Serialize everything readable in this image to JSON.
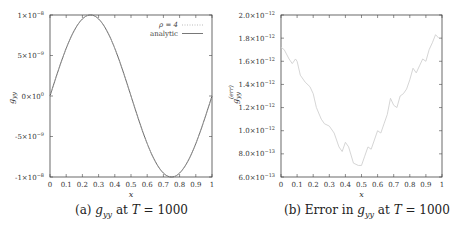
{
  "chart_data": [
    {
      "type": "line",
      "id": "a",
      "caption": {
        "prefix": "(a)",
        "var": "g",
        "sub": "yy",
        "suffix": "at",
        "T": "T",
        "eq": "= 1000"
      },
      "xlabel": "x",
      "ylabel": "g_yy",
      "xlim": [
        0,
        1
      ],
      "ylim": [
        -1e-08,
        1e-08
      ],
      "xticks": [
        "0",
        "0.1",
        "0.2",
        "0.3",
        "0.4",
        "0.5",
        "0.6",
        "0.7",
        "0.8",
        "0.9",
        "1"
      ],
      "yticks": [
        {
          "value": 1e-08,
          "label": "1×10",
          "exp": "−8"
        },
        {
          "value": 5e-09,
          "label": "5×10",
          "exp": "−9"
        },
        {
          "value": 0,
          "label": "0×10",
          "exp": "0"
        },
        {
          "value": -5e-09,
          "label": "-5×10",
          "exp": "−9"
        },
        {
          "value": -1e-08,
          "label": "-1×10",
          "exp": "−8"
        }
      ],
      "legend": {
        "position": "upper right",
        "entries": [
          {
            "label": "ρ = 4",
            "style": "dotted",
            "color": "#aaaaaa"
          },
          {
            "label": "analytic",
            "style": "solid",
            "color": "#555555"
          }
        ]
      },
      "series": [
        {
          "name": "ρ = 4",
          "function": "1e-8*sin(2*pi*x)",
          "color": "#aaaaaa"
        },
        {
          "name": "analytic",
          "function": "1e-8*sin(2*pi*x)",
          "color": "#555555"
        }
      ],
      "grid": false
    },
    {
      "type": "line",
      "id": "b",
      "caption": {
        "prefix": "(b) Error in",
        "var": "g",
        "sub": "yy",
        "suffix": "at",
        "T": "T",
        "eq": "= 1000"
      },
      "xlabel": "x",
      "ylabel": "g_yy^(err)",
      "xlim": [
        0,
        1
      ],
      "ylim": [
        6e-13,
        2e-12
      ],
      "xticks": [
        "0",
        "0.1",
        "0.2",
        "0.3",
        "0.4",
        "0.5",
        "0.6",
        "0.7",
        "0.8",
        "0.9",
        "1"
      ],
      "yticks": [
        {
          "value": 2e-12,
          "label": "2.0×10",
          "exp": "−12"
        },
        {
          "value": 1.8e-12,
          "label": "1.8×10",
          "exp": "−12"
        },
        {
          "value": 1.6e-12,
          "label": "1.6×10",
          "exp": "−12"
        },
        {
          "value": 1.4e-12,
          "label": "1.4×10",
          "exp": "−12"
        },
        {
          "value": 1.2e-12,
          "label": "1.2×10",
          "exp": "−12"
        },
        {
          "value": 1e-12,
          "label": "1.0×10",
          "exp": "−12"
        },
        {
          "value": 8e-13,
          "label": "8.0×10",
          "exp": "−13"
        },
        {
          "value": 6e-13,
          "label": "6.0×10",
          "exp": "−13"
        }
      ],
      "series": [
        {
          "name": "error",
          "color": "#d0d0d0",
          "x": [
            0,
            0.02,
            0.05,
            0.07,
            0.09,
            0.1,
            0.12,
            0.15,
            0.18,
            0.2,
            0.22,
            0.25,
            0.27,
            0.3,
            0.33,
            0.36,
            0.38,
            0.4,
            0.42,
            0.45,
            0.48,
            0.5,
            0.52,
            0.54,
            0.56,
            0.58,
            0.6,
            0.62,
            0.64,
            0.66,
            0.68,
            0.7,
            0.72,
            0.74,
            0.76,
            0.78,
            0.8,
            0.82,
            0.84,
            0.86,
            0.88,
            0.9,
            0.92,
            0.94,
            0.96,
            0.98
          ],
          "y": [
            1.72,
            1.7,
            1.62,
            1.58,
            1.62,
            1.6,
            1.48,
            1.42,
            1.38,
            1.32,
            1.2,
            1.1,
            1.06,
            1.04,
            0.98,
            0.86,
            0.82,
            0.9,
            0.86,
            0.72,
            0.7,
            0.7,
            0.78,
            0.86,
            0.84,
            0.92,
            1.0,
            0.98,
            1.06,
            1.14,
            1.28,
            1.22,
            1.2,
            1.3,
            1.32,
            1.36,
            1.44,
            1.54,
            1.5,
            1.56,
            1.62,
            1.6,
            1.7,
            1.76,
            1.83,
            1.8
          ],
          "y_unit": "1e-12"
        }
      ],
      "grid": false
    }
  ]
}
